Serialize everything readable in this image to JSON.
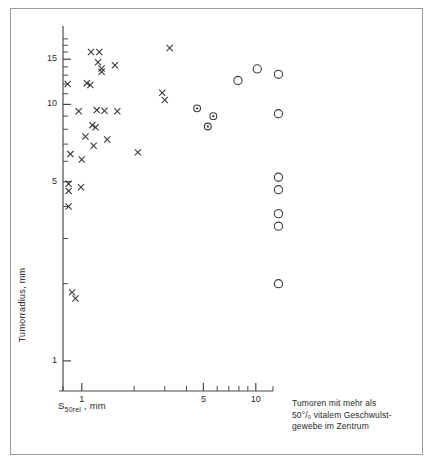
{
  "figure": {
    "title": "",
    "frame_color": "#9a9a9a",
    "axis_color": "#4a4a4a",
    "marker_color": "#3a3a3a",
    "caption_lines": [
      "Tumoren mit mehr als",
      "50°/₀ vitalem Geschwulst-",
      "gewebe im Zentrum"
    ]
  },
  "chart_data": {
    "type": "scatter",
    "title": "",
    "subtitle": "",
    "xlabel": "S50rel , mm",
    "ylabel": "Tumorradius, mm",
    "xscale": "log",
    "yscale": "log",
    "xlim": [
      0.78,
      11.6
    ],
    "ylim": [
      0.85,
      19.5
    ],
    "grid": false,
    "legend_position": "none",
    "xticks_major": [
      1,
      5,
      10
    ],
    "xtick_labels": [
      "1",
      "5",
      "10"
    ],
    "xticks_minor": [
      2,
      3,
      4,
      6,
      7,
      8,
      9
    ],
    "yticks_major": [
      1,
      5,
      10,
      15
    ],
    "ytick_labels": [
      "1",
      "5",
      "10",
      "15"
    ],
    "yticks_minor": [
      2,
      3,
      4,
      6,
      7,
      8,
      9,
      11,
      12,
      13,
      14,
      16,
      17,
      18
    ],
    "series": [
      {
        "name": "Tumoren (Kreuze)",
        "marker": "x",
        "points": [
          [
            0.83,
            12.0
          ],
          [
            0.84,
            4.9
          ],
          [
            0.84,
            4.6
          ],
          [
            0.84,
            4.0
          ],
          [
            0.86,
            6.4
          ],
          [
            0.88,
            1.85
          ],
          [
            0.92,
            1.75
          ],
          [
            0.96,
            9.4
          ],
          [
            0.99,
            4.75
          ],
          [
            1.0,
            6.1
          ],
          [
            1.05,
            7.5
          ],
          [
            1.07,
            12.1
          ],
          [
            1.12,
            11.9
          ],
          [
            1.13,
            16.0
          ],
          [
            1.15,
            8.3
          ],
          [
            1.17,
            6.9
          ],
          [
            1.2,
            8.15
          ],
          [
            1.22,
            9.5
          ],
          [
            1.24,
            14.6
          ],
          [
            1.26,
            16.0
          ],
          [
            1.3,
            13.8
          ],
          [
            1.3,
            13.4
          ],
          [
            1.35,
            9.45
          ],
          [
            1.4,
            7.3
          ],
          [
            1.55,
            14.2
          ],
          [
            1.6,
            9.4
          ],
          [
            2.1,
            6.5
          ],
          [
            2.9,
            11.1
          ],
          [
            3.0,
            10.4
          ],
          [
            3.2,
            16.6
          ]
        ]
      },
      {
        "name": "Tumoren mit Zentrumsnekrose (Kreis mit Punkt)",
        "marker": "circle-dot",
        "points": [
          [
            4.6,
            9.65
          ],
          [
            5.3,
            8.2
          ],
          [
            5.7,
            9.0
          ]
        ]
      },
      {
        "name": "Tumoren mit mehr als 50% vitalem Geschwulstgewebe im Zentrum",
        "marker": "circle",
        "points": [
          [
            7.9,
            12.4
          ],
          [
            10.2,
            13.75
          ]
        ]
      },
      {
        "name": "Tumoren mit mehr als 50% vitalem Geschwulstgewebe im Zentrum (Randspalte)",
        "marker": "circle",
        "outside_axes": true,
        "points": [
          [
            13.5,
            13.1
          ],
          [
            13.5,
            9.2
          ],
          [
            13.5,
            5.2
          ],
          [
            13.5,
            4.65
          ],
          [
            13.5,
            3.75
          ],
          [
            13.5,
            3.35
          ],
          [
            13.5,
            2.0
          ]
        ]
      }
    ]
  }
}
